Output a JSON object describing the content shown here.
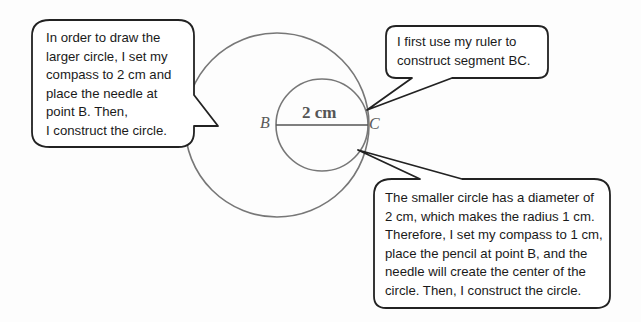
{
  "diagram": {
    "large_circle": {
      "center_point": "B",
      "radius": "2 cm"
    },
    "small_circle": {
      "diameter": "2 cm",
      "radius": "1 cm"
    },
    "segment": {
      "label": "2 cm",
      "from": "B",
      "to": "C"
    },
    "points": {
      "B": "B",
      "C": "C"
    },
    "colors": {
      "circle_stroke": "#777777",
      "callout_stroke": "#222222",
      "text": "#1a1a1a",
      "point_label": "#5a5a5a"
    }
  },
  "callouts": {
    "left": {
      "lines": [
        "In order to draw the",
        "larger circle, I set my",
        "compass to 2 cm and",
        "place the needle at",
        "point B.  Then,",
        "I construct the circle."
      ]
    },
    "top_right": {
      "lines": [
        "I first use my ruler to",
        "construct segment BC."
      ]
    },
    "bottom_right": {
      "lines": [
        "The smaller circle has a diameter of",
        "2 cm, which makes the radius 1 cm.",
        "Therefore, I set my compass to 1 cm,",
        "place the pencil at point B, and the",
        "needle will create the center of the",
        "circle.  Then, I construct the circle."
      ]
    }
  }
}
